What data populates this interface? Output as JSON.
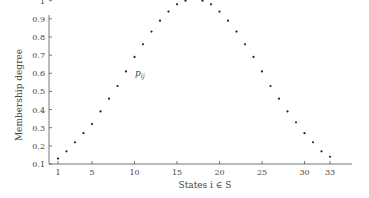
{
  "chart_data": {
    "type": "scatter",
    "title": "",
    "xlabel": "States i ∈ S",
    "ylabel": "Membership degree",
    "xlim": [
      0,
      35
    ],
    "ylim": [
      0.1,
      1.0
    ],
    "grid": false,
    "legend": null,
    "x_ticks": [
      1,
      5,
      10,
      15,
      20,
      25,
      30,
      33
    ],
    "y_ticks": [
      0.1,
      0.2,
      0.3,
      0.4,
      0.5,
      0.6,
      0.7,
      0.8,
      0.9,
      1
    ],
    "y_tick_labels": [
      "0.1",
      "0.2",
      "0.3",
      "0.4",
      "0.5",
      "0.6",
      "0.7",
      "0.8",
      "0.9",
      "1"
    ],
    "annotations": [
      {
        "text": "p_ij",
        "x": 10,
        "y": 0.63
      }
    ],
    "series": [
      {
        "name": "membership",
        "x": [
          1,
          2,
          3,
          4,
          5,
          6,
          7,
          8,
          9,
          10,
          11,
          12,
          13,
          14,
          15,
          16,
          18,
          19,
          20,
          21,
          22,
          23,
          24,
          25,
          26,
          27,
          28,
          29,
          30,
          31,
          32,
          33
        ],
        "y": [
          0.13,
          0.17,
          0.22,
          0.27,
          0.32,
          0.39,
          0.46,
          0.53,
          0.61,
          0.69,
          0.76,
          0.83,
          0.89,
          0.94,
          0.98,
          1.0,
          1.0,
          0.98,
          0.94,
          0.89,
          0.83,
          0.76,
          0.69,
          0.61,
          0.53,
          0.46,
          0.39,
          0.33,
          0.27,
          0.22,
          0.17,
          0.14
        ]
      }
    ]
  },
  "labels": {
    "xlabel": "States i ∈ S",
    "ylabel": "Membership degree",
    "annotation": "p",
    "annotation_sub": "ij"
  }
}
